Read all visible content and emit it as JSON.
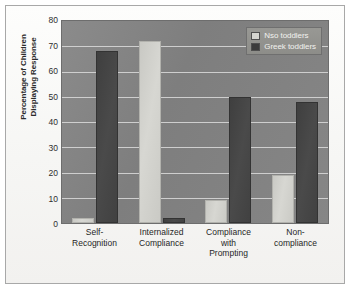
{
  "chart_data": {
    "type": "bar",
    "title": "",
    "xlabel": "",
    "ylabel": "Percentage of Children Displaying Response",
    "ylabel_line1": "Percentage of Children",
    "ylabel_line2": "Displaying Response",
    "ylim": [
      0,
      80
    ],
    "ytick_step": 10,
    "yticks": [
      80,
      70,
      60,
      50,
      40,
      30,
      20,
      10,
      0
    ],
    "grid": true,
    "legend_position": "top-right",
    "categories": [
      "Self-Recognition",
      "Internalized Compliance",
      "Compliance with Prompting",
      "Non-compliance"
    ],
    "category_lines": [
      [
        "Self-",
        "Recognition"
      ],
      [
        "Internalized",
        "Compliance"
      ],
      [
        "Compliance",
        "with",
        "Prompting"
      ],
      [
        "Non-",
        "compliance"
      ]
    ],
    "series": [
      {
        "name": "Nso toddlers",
        "color": "#d4d4cf",
        "values": [
          2,
          72,
          9,
          19
        ]
      },
      {
        "name": "Greek toddlers",
        "color": "#3c3c3c",
        "values": [
          68,
          2,
          50,
          48
        ]
      }
    ]
  },
  "colors": {
    "plot_background": "#828282",
    "page_background": "#fbfbfa",
    "frame_border": "#a8a8a8",
    "gridline": "#dcdcdc",
    "legend_background": "#91918d",
    "legend_text": "#f2f2ef",
    "axis_text": "#2e2e2e"
  }
}
